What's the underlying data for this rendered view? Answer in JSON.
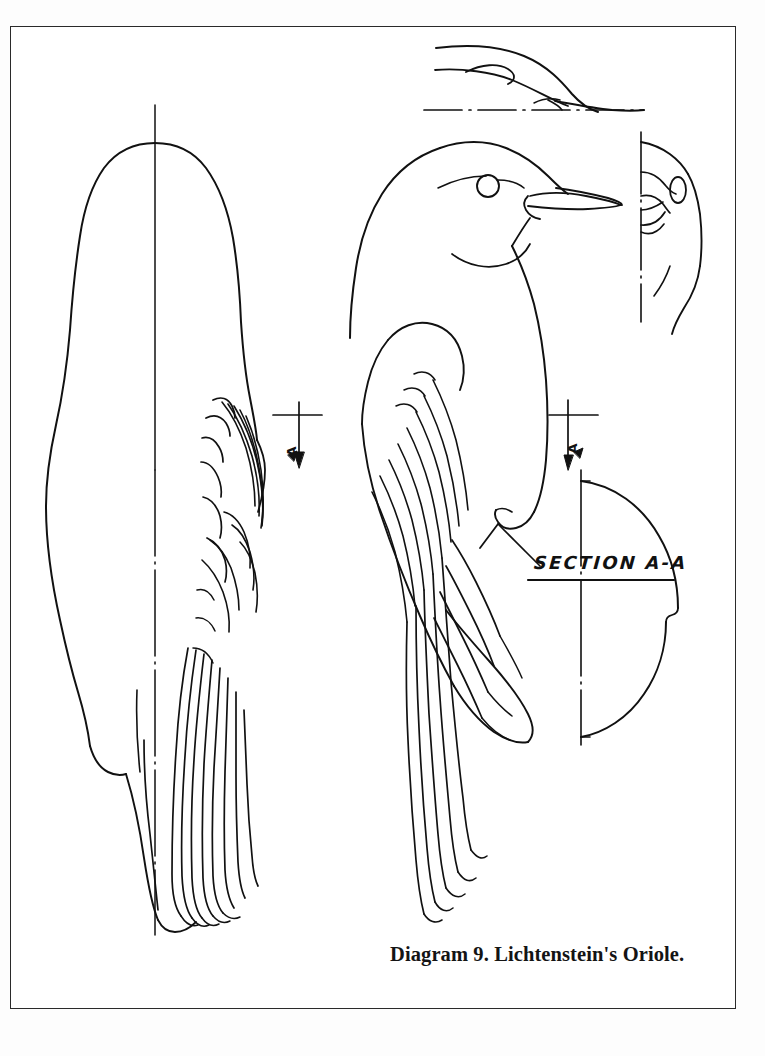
{
  "plate": {
    "kind": "technical-illustration-plate",
    "caption": "Diagram 9.  Lichtenstein's Oriole.",
    "section_label": "SECTION A-A",
    "section_mark_left_letter": "A",
    "section_mark_right_letter": "A",
    "background_color": "#ffffff",
    "ink_color": "#111111",
    "frame_color": "#2a2a2a"
  },
  "views": {
    "dorsal": {
      "name": "dorsal-top-view",
      "description": "Top (dorsal) view of bird body with centerline and folded wing feathers on right side"
    },
    "lateral": {
      "name": "lateral-side-view",
      "description": "Side profile view of bird showing head, eye, beak, folded wing and long tail"
    },
    "head_top": {
      "name": "head-top-profile-detail",
      "description": "Upper detail: beak and head profile seen from above with dashed baseline"
    },
    "head_front": {
      "name": "head-front-half-detail",
      "description": "Right detail: half front view of head with vertical centerline"
    },
    "cross_section": {
      "name": "body-cross-section-a-a",
      "description": "Half cross-section of body at station A-A with vertical centerline"
    }
  }
}
